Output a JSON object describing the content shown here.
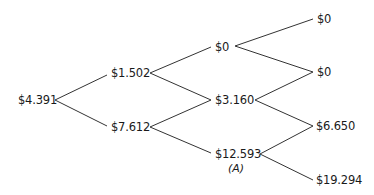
{
  "diagram": {
    "type": "binomial-tree",
    "edge_color": "#333333",
    "nodes": {
      "root": {
        "label": "$4.391"
      },
      "u": {
        "label": "$1.502"
      },
      "d": {
        "label": "$7.612"
      },
      "uu": {
        "label": "$0"
      },
      "ud": {
        "label": "$3.160"
      },
      "dd": {
        "label": "$12.593",
        "sublabel": "(A)"
      },
      "uuu": {
        "label": "$0"
      },
      "uud": {
        "label": "$0"
      },
      "udd": {
        "label": "$6.650"
      },
      "ddd": {
        "label": "$19.294"
      }
    }
  }
}
